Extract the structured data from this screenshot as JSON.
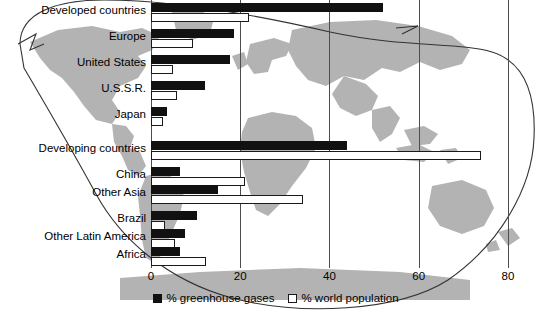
{
  "chart_data": {
    "type": "bar",
    "orientation": "horizontal",
    "title": "",
    "subtitle": "",
    "xlabel": "",
    "ylabel": "",
    "xlim": [
      0,
      80
    ],
    "xticks": [
      0,
      20,
      40,
      60,
      80
    ],
    "xtick_labels": [
      "0",
      "20",
      "40",
      "60",
      "80"
    ],
    "grid": true,
    "grid_axis": "x",
    "legend_position": "bottom-center",
    "background": "world-map-silhouette",
    "categories": [
      "Developed countries",
      "Europe",
      "United States",
      "U.S.S.R.",
      "Japan",
      "Developing countries",
      "China",
      "Other Asia",
      "Brazil",
      "Other Latin America",
      "Africa"
    ],
    "series": [
      {
        "name": "% greenhouse gases",
        "color": "#111111",
        "style": "filled",
        "values": [
          52,
          18.5,
          17.7,
          12,
          3.5,
          44,
          6.5,
          15,
          10.3,
          7.6,
          6.5
        ]
      },
      {
        "name": "% world population",
        "color": "#ffffff",
        "style": "outlined",
        "values": [
          22,
          9.5,
          5,
          5.8,
          2.7,
          74,
          21,
          34,
          3.1,
          5.4,
          12.3
        ]
      }
    ]
  },
  "legend": {
    "items": [
      {
        "label": "% greenhouse gases",
        "swatch": "filled-black-square"
      },
      {
        "label": "% world population",
        "swatch": "outlined-white-square"
      }
    ]
  },
  "colors": {
    "bar_greenhouse": "#111111",
    "bar_population": "#ffffff",
    "bar_outline": "#1a1a1a",
    "gridline": "#4d4d4d",
    "map_land": "#b3b3b3",
    "background": "#ffffff"
  }
}
